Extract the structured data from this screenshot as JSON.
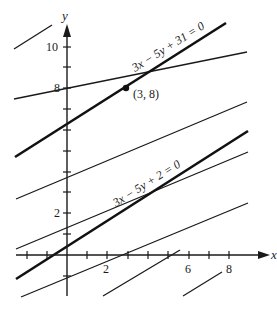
{
  "diagram": {
    "type": "coordinate-plane-parallel-lines",
    "axes": {
      "x_label": "x",
      "y_label": "y",
      "x_tick_labels": [
        {
          "value": 2,
          "text": "2"
        },
        {
          "value": 6,
          "text": "6"
        },
        {
          "value": 8,
          "text": "8"
        }
      ],
      "y_tick_labels": [
        {
          "value": 2,
          "text": "2"
        },
        {
          "value": 8,
          "text": "8"
        },
        {
          "value": 10,
          "text": "10"
        }
      ]
    },
    "highlighted_lines": [
      {
        "equation": "3x − 5y + 31 = 0"
      },
      {
        "equation": "3x − 5y + 2 = 0"
      }
    ],
    "point": {
      "label": "(3, 8)",
      "x": 3,
      "y": 8
    },
    "line_family_slope": "3/5"
  }
}
